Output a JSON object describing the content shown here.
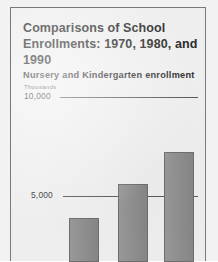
{
  "figure": {
    "background_color": "#f2f2f2",
    "card_color": "#eeeeee",
    "border_color": "#7a7a7a"
  },
  "title": "Comparisons of School Enrollments: 1970, 1980, and 1990",
  "subtitle": "Nursery and Kindergarten enrollment",
  "chart_data": {
    "type": "bar",
    "title": "Nursery and Kindergarten enrollment",
    "subtitle": "Comparisons of School Enrollments: 1970, 1980, and 1990",
    "units_label": "Thousands",
    "categories": [
      "1970",
      "1980",
      "1990"
    ],
    "values": [
      3900,
      5600,
      7200
    ],
    "series": [
      {
        "name": "Nursery and Kindergarten enrollment",
        "values": [
          3900,
          5600,
          7200
        ]
      }
    ],
    "xlabel": "",
    "ylabel": "Thousands",
    "ylim": [
      0,
      10000
    ],
    "ytick_labels": [
      "5,000",
      "10,000"
    ],
    "ytick_values": [
      5000,
      10000
    ],
    "grid": true,
    "legend": "none",
    "bar_color": "#8d8d8d",
    "bar_edge_color": "#6e6e6e",
    "gridline_color": "#5a5a5a"
  }
}
